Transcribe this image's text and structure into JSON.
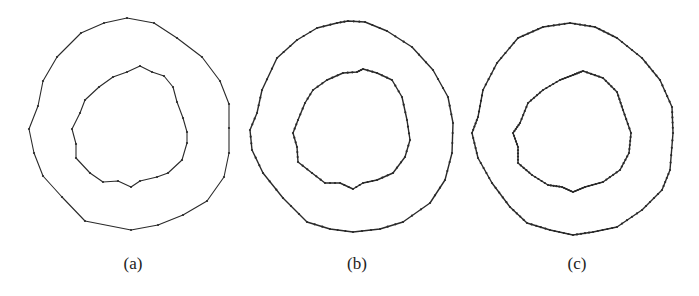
{
  "figure": {
    "panels": [
      {
        "label": "(a)",
        "label_x": 133,
        "outer": [
          [
            127,
            18
          ],
          [
            154,
            23
          ],
          [
            177,
            38
          ],
          [
            202,
            57
          ],
          [
            220,
            81
          ],
          [
            229,
            104
          ],
          [
            229,
            128
          ],
          [
            229,
            153
          ],
          [
            224,
            177
          ],
          [
            207,
            201
          ],
          [
            183,
            215
          ],
          [
            158,
            225
          ],
          [
            131,
            230
          ],
          [
            85,
            221
          ],
          [
            62,
            197
          ],
          [
            43,
            176
          ],
          [
            34,
            153
          ],
          [
            29,
            129
          ],
          [
            38,
            106
          ],
          [
            43,
            81
          ],
          [
            57,
            57
          ],
          [
            81,
            33
          ],
          [
            104,
            23
          ]
        ],
        "inner": [
          [
            140,
            66
          ],
          [
            152,
            72
          ],
          [
            164,
            76
          ],
          [
            173,
            87
          ],
          [
            177,
            102
          ],
          [
            183,
            118
          ],
          [
            187,
            132
          ],
          [
            187,
            143
          ],
          [
            182,
            160
          ],
          [
            168,
            173
          ],
          [
            157,
            177
          ],
          [
            140,
            181
          ],
          [
            131,
            187
          ],
          [
            118,
            181
          ],
          [
            103,
            182
          ],
          [
            90,
            173
          ],
          [
            76,
            158
          ],
          [
            76,
            144
          ],
          [
            72,
            129
          ],
          [
            80,
            113
          ],
          [
            85,
            100
          ],
          [
            99,
            87
          ],
          [
            113,
            77
          ],
          [
            127,
            72
          ]
        ]
      },
      {
        "label": "(b)",
        "label_x": 357,
        "outer": [
          [
            348,
            21
          ],
          [
            365,
            22
          ],
          [
            387,
            31
          ],
          [
            412,
            47
          ],
          [
            433,
            70
          ],
          [
            448,
            97
          ],
          [
            453,
            123
          ],
          [
            452,
            153
          ],
          [
            445,
            180
          ],
          [
            430,
            203
          ],
          [
            403,
            222
          ],
          [
            380,
            229
          ],
          [
            353,
            232
          ],
          [
            330,
            229
          ],
          [
            307,
            222
          ],
          [
            283,
            198
          ],
          [
            263,
            173
          ],
          [
            252,
            150
          ],
          [
            250,
            130
          ],
          [
            257,
            113
          ],
          [
            262,
            90
          ],
          [
            277,
            58
          ],
          [
            297,
            40
          ],
          [
            317,
            28
          ],
          [
            337,
            23
          ]
        ],
        "inner": [
          [
            363,
            69
          ],
          [
            377,
            73
          ],
          [
            392,
            80
          ],
          [
            402,
            97
          ],
          [
            407,
            120
          ],
          [
            410,
            140
          ],
          [
            405,
            157
          ],
          [
            393,
            173
          ],
          [
            377,
            180
          ],
          [
            363,
            183
          ],
          [
            353,
            189
          ],
          [
            340,
            183
          ],
          [
            325,
            183
          ],
          [
            312,
            173
          ],
          [
            298,
            162
          ],
          [
            297,
            147
          ],
          [
            293,
            133
          ],
          [
            298,
            120
          ],
          [
            305,
            103
          ],
          [
            313,
            90
          ],
          [
            327,
            80
          ],
          [
            343,
            73
          ],
          [
            357,
            72
          ]
        ]
      },
      {
        "label": "(c)",
        "label_x": 577,
        "outer": [
          [
            570,
            23
          ],
          [
            595,
            27
          ],
          [
            617,
            38
          ],
          [
            642,
            58
          ],
          [
            660,
            80
          ],
          [
            672,
            107
          ],
          [
            673,
            133
          ],
          [
            670,
            170
          ],
          [
            662,
            190
          ],
          [
            642,
            210
          ],
          [
            617,
            227
          ],
          [
            593,
            232
          ],
          [
            573,
            235
          ],
          [
            550,
            230
          ],
          [
            527,
            223
          ],
          [
            510,
            207
          ],
          [
            492,
            183
          ],
          [
            478,
            158
          ],
          [
            472,
            133
          ],
          [
            478,
            117
          ],
          [
            483,
            90
          ],
          [
            497,
            63
          ],
          [
            518,
            38
          ],
          [
            543,
            27
          ]
        ],
        "inner": [
          [
            583,
            71
          ],
          [
            603,
            78
          ],
          [
            617,
            92
          ],
          [
            623,
            110
          ],
          [
            631,
            133
          ],
          [
            629,
            153
          ],
          [
            620,
            170
          ],
          [
            603,
            182
          ],
          [
            585,
            187
          ],
          [
            573,
            192
          ],
          [
            562,
            187
          ],
          [
            548,
            185
          ],
          [
            532,
            175
          ],
          [
            518,
            163
          ],
          [
            518,
            147
          ],
          [
            513,
            133
          ],
          [
            520,
            123
          ],
          [
            528,
            103
          ],
          [
            543,
            90
          ],
          [
            560,
            80
          ],
          [
            573,
            75
          ]
        ]
      }
    ],
    "stroke_color": "#2a2a2a",
    "vertex_density": {
      "(a)": "sparse",
      "(b)": "medium",
      "(c)": "dense"
    }
  }
}
